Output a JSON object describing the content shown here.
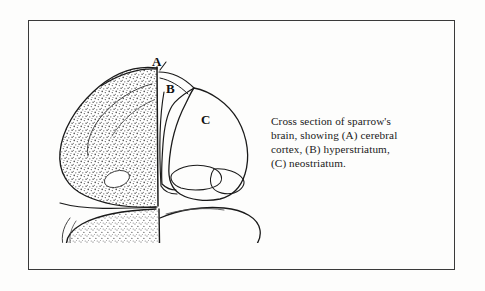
{
  "figure": {
    "frame_color": "#3a3a3a",
    "background_color": "#fdfdfc",
    "ink_color": "#1a1a1a",
    "stipple_color": "#4a4a4a",
    "labels": {
      "a": "A",
      "b": "B",
      "c": "C"
    },
    "regions": [
      {
        "key": "A",
        "name": "cerebral cortex",
        "shading": "stippled"
      },
      {
        "key": "B",
        "name": "hyperstriatum",
        "shading": "outline"
      },
      {
        "key": "C",
        "name": "neostriatum",
        "shading": "outline"
      }
    ]
  },
  "caption": {
    "lines": [
      "Cross section of sparrow's",
      "brain, showing (A) cerebral",
      "cortex, (B) hyperstriatum,",
      "(C) neostriatum."
    ],
    "full_text": "Cross section of sparrow's brain, showing (A) cerebral cortex, (B) hyperstriatum, (C) neostriatum."
  }
}
